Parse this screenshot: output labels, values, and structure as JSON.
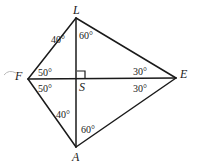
{
  "figure": {
    "stroke_color": "#1a1a1a",
    "background_color": "#ffffff",
    "degree_symbol": "°",
    "vertices": [
      {
        "name": "L",
        "label": "L",
        "x": 76,
        "y": 18
      },
      {
        "name": "F",
        "label": "F",
        "x": 28,
        "y": 79
      },
      {
        "name": "E",
        "label": "E",
        "x": 176,
        "y": 78
      },
      {
        "name": "A",
        "label": "A",
        "x": 76,
        "y": 147
      },
      {
        "name": "S",
        "label": "S",
        "x": 77,
        "y": 79
      }
    ],
    "vertex_labels": [
      {
        "name": "vertex-label-L",
        "text": "L",
        "x": 73,
        "y": 4
      },
      {
        "name": "vertex-label-F",
        "text": "F",
        "x": 15,
        "y": 70
      },
      {
        "name": "vertex-label-E",
        "text": "E",
        "x": 180,
        "y": 68
      },
      {
        "name": "vertex-label-A",
        "text": "A",
        "x": 72,
        "y": 151
      },
      {
        "name": "vertex-label-S",
        "text": "S",
        "x": 79,
        "y": 81
      }
    ],
    "segments": [
      {
        "name": "segment-F-L",
        "from": "F",
        "to": "L"
      },
      {
        "name": "segment-L-E",
        "from": "L",
        "to": "E"
      },
      {
        "name": "segment-F-A",
        "from": "F",
        "to": "A"
      },
      {
        "name": "segment-A-E",
        "from": "A",
        "to": "E"
      },
      {
        "name": "diagonal-F-E",
        "from": "F",
        "to": "E"
      },
      {
        "name": "diagonal-L-A",
        "from": "L",
        "to": "A"
      }
    ],
    "right_angle_marker": {
      "name": "right-angle-marker-S",
      "at": "S",
      "quadrant": "upper-right",
      "size": 8
    },
    "angles": [
      {
        "name": "angle-FLS",
        "vertex": "L",
        "value": "40",
        "text": "40°",
        "x": 51,
        "y": 35
      },
      {
        "name": "angle-SLE",
        "vertex": "L",
        "value": "60",
        "text": "60°",
        "x": 79,
        "y": 31
      },
      {
        "name": "angle-LFS",
        "vertex": "F",
        "value": "50",
        "text": "50°",
        "x": 38,
        "y": 68
      },
      {
        "name": "angle-SFA",
        "vertex": "F",
        "value": "50",
        "text": "50°",
        "x": 38,
        "y": 84
      },
      {
        "name": "angle-LES",
        "vertex": "E",
        "value": "30",
        "text": "30°",
        "x": 133,
        "y": 67
      },
      {
        "name": "angle-SEA",
        "vertex": "E",
        "value": "30",
        "text": "30°",
        "x": 133,
        "y": 84
      },
      {
        "name": "angle-FAS",
        "vertex": "A",
        "value": "40",
        "text": "40°",
        "x": 56,
        "y": 110
      },
      {
        "name": "angle-SAE",
        "vertex": "A",
        "value": "60",
        "text": "60°",
        "x": 81,
        "y": 125
      }
    ],
    "artifact": {
      "name": "scan-artifact-mark",
      "x": 4,
      "y": 70,
      "width": 12,
      "height": 5
    }
  }
}
